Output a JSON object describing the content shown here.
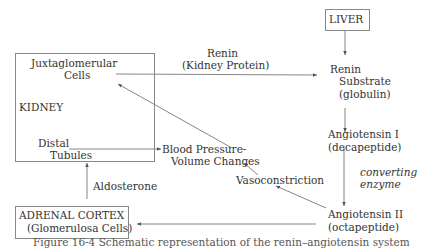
{
  "diagram": {
    "nodes": {
      "liver": "LIVER",
      "kidney": "KIDNEY",
      "juxta_line1": "Juxtaglomerular",
      "juxta_line2": "Cells",
      "distal_line1": "Distal",
      "distal_line2": "Tubules",
      "renin_sub_line1": "Renin",
      "renin_sub_line2": "Substrate",
      "renin_sub_line3": "(globulin)",
      "ang1_line1": "Angiotensin I",
      "ang1_line2": "(decapeptide)",
      "ang2_line1": "Angiotensin II",
      "ang2_line2": "(octapeptide)",
      "bp_line1": "Blood Pressure-",
      "bp_line2": "Volume Changes",
      "adrenal_line1": "ADRENAL CORTEX",
      "adrenal_line2": "(Glomerulosa Cells)"
    },
    "edge_labels": {
      "renin_line1": "Renin",
      "renin_line2": "(Kidney Protein)",
      "converting_line1": "converting",
      "converting_line2": "enzyme",
      "vasoconstriction": "Vasoconstriction",
      "aldosterone": "Aldosterone"
    },
    "caption": "Figure 16-4 Schematic representation of the renin–angiotensin system"
  }
}
